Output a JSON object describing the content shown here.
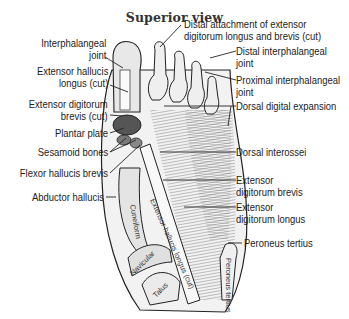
{
  "diagram": {
    "title": "Superior view",
    "left_labels": [
      {
        "id": "interphalangeal-joint",
        "lines": [
          "Interphalangeal",
          "joint"
        ]
      },
      {
        "id": "extensor-hallucis-longus-cut",
        "lines": [
          "Extensor hallucis",
          "longus (cut)"
        ]
      },
      {
        "id": "extensor-digitorum-brevis-cut",
        "lines": [
          "Extensor digitorum",
          "brevis (cut)"
        ]
      },
      {
        "id": "plantar-plate",
        "lines": [
          "Plantar plate"
        ]
      },
      {
        "id": "sesamoid-bones",
        "lines": [
          "Sesamoid bones"
        ]
      },
      {
        "id": "flexor-hallucis-brevis",
        "lines": [
          "Flexor hallucis brevis"
        ]
      },
      {
        "id": "abductor-hallucis",
        "lines": [
          "Abductor hallucis"
        ]
      }
    ],
    "right_labels": [
      {
        "id": "distal-attachment",
        "lines": [
          "Distal attachment of extensor",
          "digitorum longus and brevis (cut)"
        ]
      },
      {
        "id": "distal-interphalangeal-joint",
        "lines": [
          "Distal interphalangeal",
          "joint"
        ]
      },
      {
        "id": "proximal-interphalangeal-joint",
        "lines": [
          "Proximal interphalangeal",
          "joint"
        ]
      },
      {
        "id": "dorsal-digital-expansion",
        "lines": [
          "Dorsal digital expansion"
        ]
      },
      {
        "id": "dorsal-interossei",
        "lines": [
          "Dorsal interossei"
        ]
      },
      {
        "id": "extensor-digitorum-brevis",
        "lines": [
          "Extensor",
          "digitorum brevis"
        ]
      },
      {
        "id": "extensor-digitorum-longus",
        "lines": [
          "Extensor",
          "digitorum longus"
        ]
      },
      {
        "id": "peroneus-tertius",
        "lines": [
          "Peroneus tertius"
        ]
      }
    ],
    "inline_labels": {
      "cuneiform": "Cuneiform",
      "navicular": "Navicular",
      "talus": "Talus",
      "extensor_hallucis_longus": "Extensor hallucis longus (cut)",
      "peroneus_tertius_tendon": "Peroneus tertius"
    },
    "colors": {
      "ink": "#222222",
      "background": "#ffffff"
    }
  }
}
